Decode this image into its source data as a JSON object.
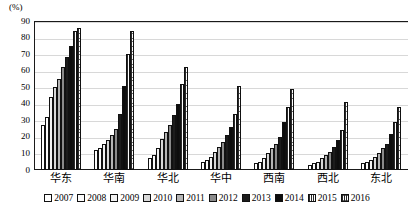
{
  "chart_data": {
    "type": "bar",
    "title": "",
    "subtitle": "",
    "xlabel": "",
    "ylabel": "(%)",
    "unit_label": "(%)",
    "ylim": [
      0,
      90
    ],
    "ytick_step": 10,
    "yticks": [
      "90",
      "80",
      "70",
      "60",
      "50",
      "40",
      "30",
      "20",
      "10",
      "0"
    ],
    "grid": true,
    "legend_position": "bottom",
    "categories": [
      "华东",
      "华南",
      "华北",
      "华中",
      "西南",
      "西北",
      "东北"
    ],
    "series": [
      {
        "name": "2007",
        "values": [
          27,
          12,
          7,
          5,
          4,
          3,
          4
        ]
      },
      {
        "name": "2008",
        "values": [
          32,
          13,
          9,
          6,
          5,
          4,
          5
        ]
      },
      {
        "name": "2009",
        "values": [
          44,
          16,
          13,
          8,
          7,
          5,
          6
        ]
      },
      {
        "name": "2010",
        "values": [
          50,
          18,
          19,
          11,
          10,
          7,
          8
        ]
      },
      {
        "name": "2011",
        "values": [
          55,
          21,
          23,
          14,
          13,
          9,
          10
        ]
      },
      {
        "name": "2012",
        "values": [
          62,
          25,
          27,
          17,
          16,
          11,
          13
        ]
      },
      {
        "name": "2013",
        "values": [
          68,
          34,
          33,
          21,
          20,
          14,
          16
        ]
      },
      {
        "name": "2014",
        "values": [
          75,
          51,
          40,
          26,
          29,
          18,
          22
        ]
      },
      {
        "name": "2015",
        "values": [
          84,
          70,
          52,
          34,
          38,
          24,
          29
        ]
      },
      {
        "name": "2016",
        "values": [
          86,
          84,
          62,
          51,
          49,
          41,
          38
        ]
      }
    ]
  },
  "legend": {
    "items": [
      {
        "label": "2007",
        "fill": "white-outline"
      },
      {
        "label": "2008",
        "fill": "white-outline"
      },
      {
        "label": "2009",
        "fill": "light-gray"
      },
      {
        "label": "2010",
        "fill": "gray"
      },
      {
        "label": "2011",
        "fill": "medium-gray"
      },
      {
        "label": "2012",
        "fill": "dark-gray"
      },
      {
        "label": "2013",
        "fill": "black"
      },
      {
        "label": "2014",
        "fill": "black"
      },
      {
        "label": "2015",
        "fill": "vertical-hatch"
      },
      {
        "label": "2016",
        "fill": "cross-hatch"
      }
    ]
  }
}
